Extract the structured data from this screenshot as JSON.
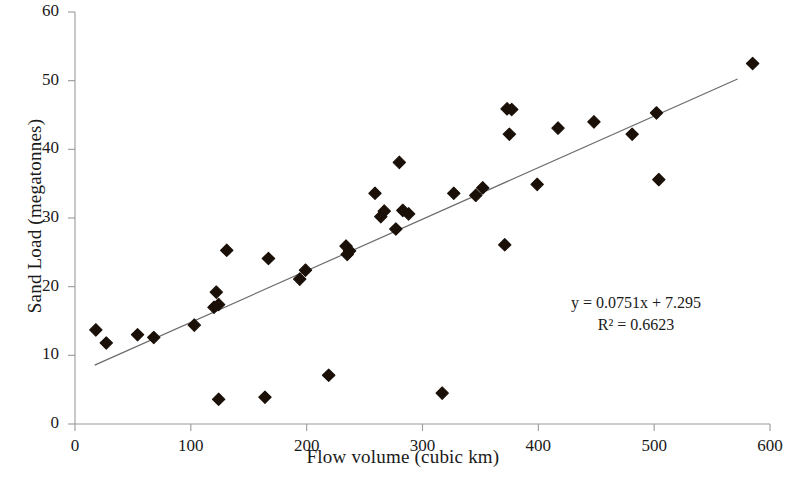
{
  "chart_data": {
    "type": "scatter",
    "title": "",
    "xlabel": "Flow volume (cubic km)",
    "ylabel": "Sand Load (megatonnes)",
    "xlim": [
      0,
      600
    ],
    "ylim": [
      0,
      60
    ],
    "x_ticks": [
      0,
      100,
      200,
      300,
      400,
      500,
      600
    ],
    "y_ticks": [
      0,
      10,
      20,
      30,
      40,
      50,
      60
    ],
    "grid": false,
    "legend": null,
    "marker": "diamond",
    "marker_color": "#1a1008",
    "points": [
      {
        "x": 18,
        "y": 13.7
      },
      {
        "x": 27,
        "y": 11.8
      },
      {
        "x": 54,
        "y": 13.0
      },
      {
        "x": 68,
        "y": 12.6
      },
      {
        "x": 103,
        "y": 14.4
      },
      {
        "x": 120,
        "y": 17.0
      },
      {
        "x": 122,
        "y": 19.2
      },
      {
        "x": 124,
        "y": 17.4
      },
      {
        "x": 124,
        "y": 3.6
      },
      {
        "x": 131,
        "y": 25.3
      },
      {
        "x": 164,
        "y": 3.9
      },
      {
        "x": 167,
        "y": 24.1
      },
      {
        "x": 194,
        "y": 21.1
      },
      {
        "x": 199,
        "y": 22.4
      },
      {
        "x": 219,
        "y": 7.1
      },
      {
        "x": 234,
        "y": 25.9
      },
      {
        "x": 235,
        "y": 24.7
      },
      {
        "x": 237,
        "y": 25.2
      },
      {
        "x": 259,
        "y": 33.6
      },
      {
        "x": 264,
        "y": 30.2
      },
      {
        "x": 267,
        "y": 31.0
      },
      {
        "x": 277,
        "y": 28.4
      },
      {
        "x": 280,
        "y": 38.1
      },
      {
        "x": 283,
        "y": 31.1
      },
      {
        "x": 288,
        "y": 30.6
      },
      {
        "x": 317,
        "y": 4.5
      },
      {
        "x": 327,
        "y": 33.6
      },
      {
        "x": 346,
        "y": 33.3
      },
      {
        "x": 352,
        "y": 34.4
      },
      {
        "x": 371,
        "y": 26.1
      },
      {
        "x": 373,
        "y": 45.9
      },
      {
        "x": 377,
        "y": 45.8
      },
      {
        "x": 375,
        "y": 42.2
      },
      {
        "x": 399,
        "y": 34.9
      },
      {
        "x": 417,
        "y": 43.1
      },
      {
        "x": 448,
        "y": 44.0
      },
      {
        "x": 481,
        "y": 42.2
      },
      {
        "x": 502,
        "y": 45.3
      },
      {
        "x": 504,
        "y": 35.6
      },
      {
        "x": 585,
        "y": 52.5
      }
    ],
    "trendline": {
      "slope": 0.0751,
      "intercept": 7.295,
      "x_start": 17,
      "x_end": 572,
      "color": "#6b6b6b"
    },
    "annotations": {
      "equation": "y = 0.0751x + 7.295",
      "r_squared": "R² = 0.6623"
    }
  },
  "axes": {
    "x_title": "Flow volume (cubic km)",
    "y_title": "Sand Load (megatonnes)",
    "x_tick_labels": [
      "0",
      "100",
      "200",
      "300",
      "400",
      "500",
      "600"
    ],
    "y_tick_labels": [
      "0",
      "10",
      "20",
      "30",
      "40",
      "50",
      "60"
    ]
  },
  "annotation": {
    "equation": "y = 0.0751x + 7.295",
    "r_squared": "R² = 0.6623"
  },
  "colors": {
    "marker": "#1a1008",
    "trendline": "#6b6b6b",
    "axis": "#9a9a9a",
    "text": "#1a1a1a"
  }
}
